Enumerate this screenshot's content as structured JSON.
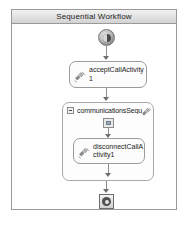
{
  "window": {
    "title": "Sequential Workflow"
  },
  "colors": {
    "surface": "#ffffff",
    "border": "#9a9a9a",
    "title_bar_top": "#f2f2f2",
    "title_bar_bottom": "#d2d2d2",
    "connector": "#8d8d8d",
    "text": "#1b1b1b"
  },
  "workflow": {
    "start_node": {
      "icon": "start-circle-icon"
    },
    "steps": [
      {
        "id": "acceptCallActivity1",
        "label": "acceptCallActivity1",
        "icon": "call-activity-icon",
        "type": "activity"
      },
      {
        "id": "communicationsSequ",
        "label": "communicationsSequ",
        "icon": "sequence-activity-icon",
        "expander": "collapse-toggle-icon",
        "connector_icon": "sequence-connector-icon",
        "type": "composite",
        "children": [
          {
            "id": "disconnectCallActivity1",
            "label": "disconnectCallActivity1",
            "icon": "call-activity-icon",
            "type": "activity"
          }
        ]
      }
    ],
    "end_node": {
      "icon": "stop-square-icon"
    }
  }
}
